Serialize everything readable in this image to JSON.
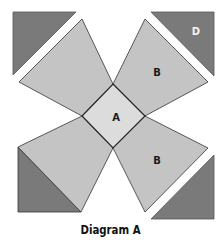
{
  "diagram": {
    "caption": "Diagram A",
    "colors": {
      "light_square": "#dcdcdc",
      "kite": "#c4c4c4",
      "dark_triangle": "#7a7a7a",
      "stroke": "#333333"
    },
    "labels": {
      "center_square": "A",
      "kite_top_right": "B",
      "kite_bottom_right": "B",
      "triangle_top_right": "D"
    }
  }
}
